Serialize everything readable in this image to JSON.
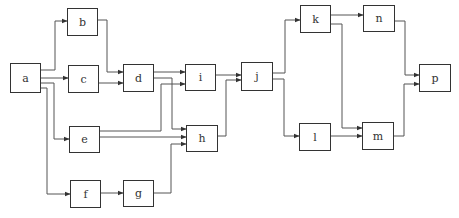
{
  "diagram": {
    "type": "flow network / precedence graph",
    "nodes": [
      {
        "id": "a",
        "label": "a",
        "x": 10,
        "y": 63,
        "w": 31,
        "h": 30
      },
      {
        "id": "b",
        "label": "b",
        "x": 67,
        "y": 8,
        "w": 31,
        "h": 28
      },
      {
        "id": "c",
        "label": "c",
        "x": 68,
        "y": 65,
        "w": 31,
        "h": 28
      },
      {
        "id": "d",
        "label": "d",
        "x": 123,
        "y": 64,
        "w": 31,
        "h": 28
      },
      {
        "id": "e",
        "label": "e",
        "x": 69,
        "y": 126,
        "w": 31,
        "h": 27
      },
      {
        "id": "f",
        "label": "f",
        "x": 70,
        "y": 180,
        "w": 31,
        "h": 28
      },
      {
        "id": "g",
        "label": "g",
        "x": 123,
        "y": 180,
        "w": 31,
        "h": 27
      },
      {
        "id": "i",
        "label": "i",
        "x": 185,
        "y": 64,
        "w": 31,
        "h": 27
      },
      {
        "id": "h",
        "label": "h",
        "x": 186,
        "y": 125,
        "w": 32,
        "h": 27
      },
      {
        "id": "j",
        "label": "j",
        "x": 241,
        "y": 62,
        "w": 32,
        "h": 29
      },
      {
        "id": "k",
        "label": "k",
        "x": 300,
        "y": 5,
        "w": 31,
        "h": 28
      },
      {
        "id": "l",
        "label": "l",
        "x": 299,
        "y": 123,
        "w": 32,
        "h": 28
      },
      {
        "id": "n",
        "label": "n",
        "x": 363,
        "y": 5,
        "w": 32,
        "h": 27
      },
      {
        "id": "m",
        "label": "m",
        "x": 362,
        "y": 122,
        "w": 32,
        "h": 28
      },
      {
        "id": "p",
        "label": "p",
        "x": 419,
        "y": 64,
        "w": 32,
        "h": 28
      }
    ],
    "edges": [
      {
        "from": "a",
        "to": "b",
        "path": "M41,70 L55,70 L55,21 L67,21"
      },
      {
        "from": "a",
        "to": "c",
        "path": "M41,78 L68,78"
      },
      {
        "from": "a",
        "to": "e",
        "path": "M41,83 L54,83 L54,139 L69,139"
      },
      {
        "from": "a",
        "to": "f",
        "path": "M41,88 L47,88 L47,194 L70,194"
      },
      {
        "from": "b",
        "to": "d",
        "path": "M98,20 L107,20 L107,72 L123,72"
      },
      {
        "from": "c",
        "to": "d",
        "path": "M99,83 L123,83"
      },
      {
        "from": "d",
        "to": "i",
        "path": "M154,72 L185,72"
      },
      {
        "from": "d",
        "to": "h",
        "path": "M154,78 L172,78 L172,129 L186,129"
      },
      {
        "from": "e",
        "to": "i",
        "path": "M100,131 L161,131 L161,84 L185,84"
      },
      {
        "from": "e",
        "to": "h",
        "path": "M100,137 L186,137"
      },
      {
        "from": "f",
        "to": "g",
        "path": "M101,193 L123,193"
      },
      {
        "from": "g",
        "to": "h",
        "path": "M154,193 L171,193 L171,144 L186,144"
      },
      {
        "from": "i",
        "to": "j",
        "path": "M216,75 L241,75"
      },
      {
        "from": "h",
        "to": "j",
        "path": "M218,136 L226,136 L226,80 L241,80"
      },
      {
        "from": "j",
        "to": "k",
        "path": "M273,73 L285,73 L285,20 L300,20"
      },
      {
        "from": "j",
        "to": "l",
        "path": "M273,79 L284,79 L284,136 L299,136"
      },
      {
        "from": "k",
        "to": "n",
        "path": "M331,15 L363,15"
      },
      {
        "from": "k",
        "to": "m",
        "path": "M331,24 L342,24 L342,128 L362,128"
      },
      {
        "from": "l",
        "to": "m",
        "path": "M331,136 L362,136"
      },
      {
        "from": "n",
        "to": "p",
        "path": "M395,21 L405,21 L405,75 L419,75"
      },
      {
        "from": "m",
        "to": "p",
        "path": "M394,136 L404,136 L404,84 L419,84"
      }
    ],
    "colors": {
      "line": "#555555",
      "border": "#333333",
      "text": "#333333",
      "background": "#ffffff"
    }
  }
}
